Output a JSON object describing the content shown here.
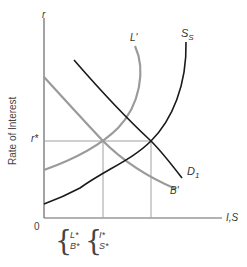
{
  "diagram": {
    "y_axis": {
      "label": "Rate of Interest",
      "symbol": "r",
      "marked_value": "r*"
    },
    "x_axis": {
      "symbol": "I,S",
      "origin": "0"
    },
    "curves": [
      {
        "id": "L",
        "label": "L'",
        "color": "#9a9a9a"
      },
      {
        "id": "B",
        "label": "B'",
        "color": "#9a9a9a"
      },
      {
        "id": "D",
        "label": "D",
        "subscript": "1",
        "color": "#1a1a1a"
      },
      {
        "id": "S",
        "label": "S",
        "subscript": "S",
        "color": "#1a1a1a"
      }
    ],
    "equilibrium_labels": {
      "left_group": [
        "L*",
        "B*"
      ],
      "right_group": [
        "I*",
        "S*"
      ]
    },
    "colors": {
      "gray_curve": "#9a9a9a",
      "black_curve": "#1a1a1a",
      "axis": "#555555",
      "guide": "#a0a0a0"
    }
  }
}
